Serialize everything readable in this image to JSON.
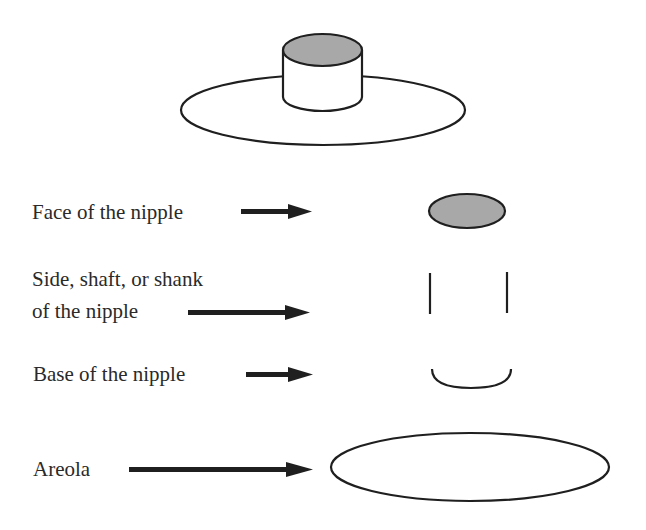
{
  "diagram": {
    "title": "",
    "colors": {
      "stroke": "#1f1f1f",
      "face_fill": "#a8a8a8",
      "background": "#ffffff"
    },
    "labels": {
      "face": "Face of the nipple",
      "side_line1": "Side, shaft, or shank",
      "side_line2": "of the nipple",
      "base": "Base of the nipple",
      "areola": "Areola"
    },
    "parts": [
      {
        "name": "face",
        "label": "Face of the nipple",
        "shape": "shaded ellipse"
      },
      {
        "name": "side",
        "label": "Side, shaft, or shank of the nipple",
        "shape": "two vertical lines"
      },
      {
        "name": "base",
        "label": "Base of the nipple",
        "shape": "lower arc"
      },
      {
        "name": "areola",
        "label": "Areola",
        "shape": "large ellipse"
      }
    ]
  }
}
